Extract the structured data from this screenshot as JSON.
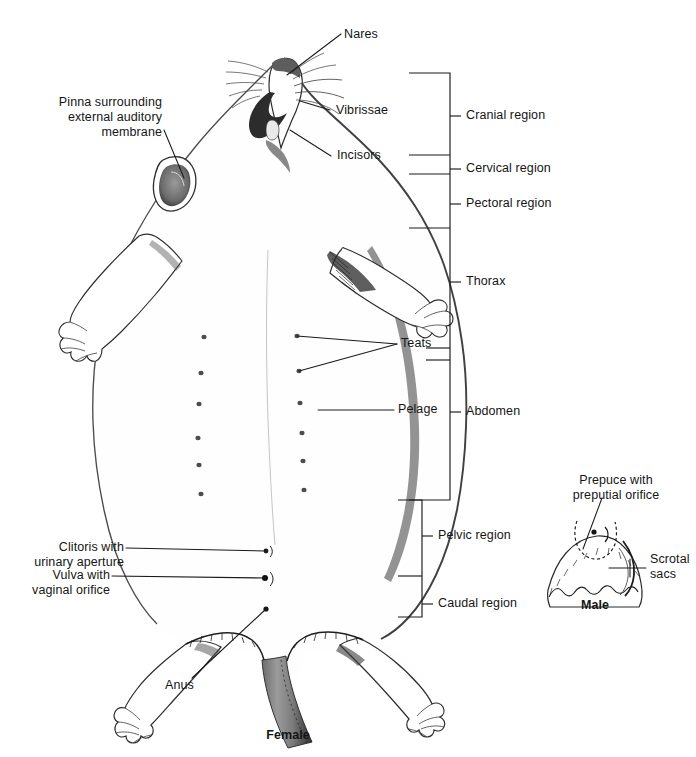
{
  "figure": {
    "background_color": "#ffffff",
    "line_color": "#1a1a1a",
    "specimens": [
      {
        "name": "female",
        "caption": "Female"
      },
      {
        "name": "male",
        "caption": "Male"
      }
    ]
  },
  "labels": {
    "nares": "Nares",
    "vibrissae": "Vibrissae",
    "incisors": "Incisors",
    "pinna_line1": "Pinna surrounding",
    "pinna_line2": "external auditory",
    "pinna_line3": "membrane",
    "teats": "Teats",
    "pelage": "Pelage",
    "clitoris_line1": "Clitoris with",
    "clitoris_line2": "urinary aperture",
    "vulva_line1": "Vulva with",
    "vulva_line2": "vaginal orifice",
    "anus": "Anus",
    "female_caption": "Female",
    "prepuce_line1": "Prepuce with",
    "prepuce_line2": "preputial orifice",
    "scrotal_line1": "Scrotal",
    "scrotal_line2": "sacs",
    "male_caption": "Male"
  },
  "regions": {
    "title": "Body regions bracket",
    "items": [
      {
        "key": "cranial",
        "label": "Cranial region"
      },
      {
        "key": "cervical",
        "label": "Cervical region"
      },
      {
        "key": "pectoral",
        "label": "Pectoral region"
      },
      {
        "key": "thorax",
        "label": "Thorax"
      },
      {
        "key": "abdomen",
        "label": "Abdomen"
      },
      {
        "key": "pelvic",
        "label": "Pelvic region"
      },
      {
        "key": "caudal",
        "label": "Caudal region"
      }
    ]
  },
  "anatomy_counts": {
    "teat_pairs": 6,
    "teat_rows": 2
  }
}
